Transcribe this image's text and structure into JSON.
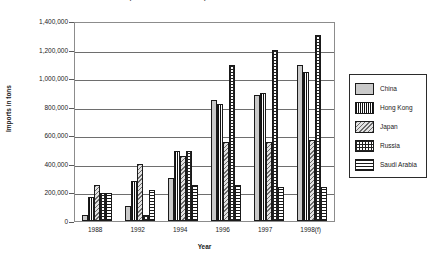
{
  "chart_data": {
    "type": "bar",
    "title": "Imports of Recovered Paper to Asian Countries",
    "xlabel": "Year",
    "ylabel": "Imports in tons",
    "categories": [
      "1988",
      "1992",
      "1994",
      "1996",
      "1997",
      "1998(f)"
    ],
    "ylim": [
      0,
      1400000
    ],
    "yticks": [
      "0",
      "200,000",
      "400,000",
      "600,000",
      "800,000",
      "1,000,000",
      "1,200,000",
      "1,400,000"
    ],
    "ytick_values": [
      0,
      200000,
      400000,
      600000,
      800000,
      1000000,
      1200000,
      1400000
    ],
    "grid": true,
    "legend_position": "right",
    "series": [
      {
        "name": "China",
        "pattern": "solid-gray",
        "values": [
          40000,
          105000,
          300000,
          850000,
          880000,
          1095000
        ]
      },
      {
        "name": "Hong Kong",
        "pattern": "vertical-stripes",
        "values": [
          170000,
          280000,
          490000,
          820000,
          895000,
          1045000
        ]
      },
      {
        "name": "Japan",
        "pattern": "diagonal-hatch",
        "values": [
          250000,
          400000,
          455000,
          555000,
          550000,
          565000
        ]
      },
      {
        "name": "Russia",
        "pattern": "cross-hatch",
        "values": [
          195000,
          40000,
          490000,
          1095000,
          1200000,
          1300000
        ]
      },
      {
        "name": "Saudi Arabia",
        "pattern": "horizontal-lines",
        "values": [
          195000,
          215000,
          255000,
          250000,
          235000,
          235000
        ]
      }
    ]
  },
  "colors": {
    "axis": "#1a1a1a",
    "grid": "#6e6e6e",
    "plot_border": "#8c8c8c",
    "china_fill": "#c9c9c9",
    "japan_fill": "#e2e2e2"
  }
}
